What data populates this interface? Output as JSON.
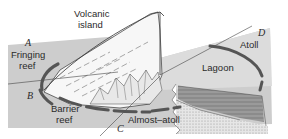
{
  "diagram": {
    "stages": [
      {
        "letter": "A",
        "name_lines": [
          "Fringing",
          "reef"
        ]
      },
      {
        "letter": "B",
        "name_lines": [
          "Barrier",
          "reef"
        ]
      },
      {
        "letter": "C",
        "name_lines": [
          "Almost–atoll"
        ]
      },
      {
        "letter": "D",
        "name_lines": [
          "Atoll"
        ]
      }
    ],
    "labels": {
      "volcanic_island_line1": "Volcanic",
      "volcanic_island_line2": "island",
      "lagoon": "Lagoon"
    },
    "colors": {
      "sea": "#cfcfcf",
      "sea_light": "#e2e2e2",
      "reef": "#5a5a5a",
      "rock": "#f4f4f4",
      "line": "#333333",
      "section_dark": "#8a8a8a",
      "section_light": "#d8d8d8"
    }
  }
}
